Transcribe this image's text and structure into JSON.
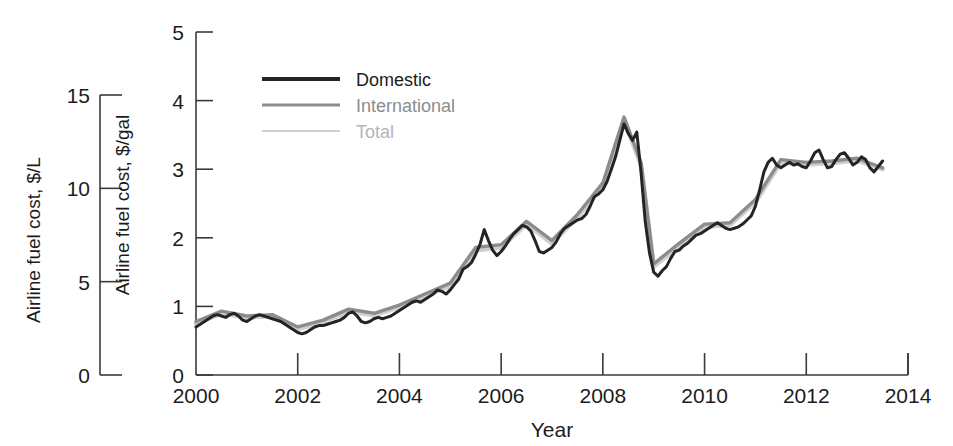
{
  "chart_data": {
    "type": "line",
    "title": "",
    "xlabel": "Year",
    "ylabel": "Airline fuel cost, $/gal",
    "ylabel_secondary": "Airline fuel cost, $/L",
    "xlim": [
      2000,
      2014
    ],
    "ylim": [
      0,
      5
    ],
    "ylim_secondary": [
      0,
      15
    ],
    "xticks": [
      2000,
      2002,
      2004,
      2006,
      2008,
      2010,
      2012,
      2014
    ],
    "xticklabels": [
      "2000",
      "2002",
      "2004",
      "2006",
      "2008",
      "2010",
      "2012",
      "2014"
    ],
    "yticks": [
      0,
      1,
      2,
      3,
      4,
      5
    ],
    "yticklabels": [
      "0",
      "1",
      "2",
      "3",
      "4",
      "5"
    ],
    "yticks_secondary": [
      0,
      5,
      10,
      15
    ],
    "yticklabels_secondary": [
      "0",
      "5",
      "10",
      "15"
    ],
    "grid": false,
    "legend_position": "upper left inside",
    "series": [
      {
        "name": "Domestic",
        "color": "#242424",
        "x": [
          2000.0,
          2000.083,
          2000.167,
          2000.25,
          2000.333,
          2000.417,
          2000.5,
          2000.583,
          2000.667,
          2000.75,
          2000.833,
          2000.917,
          2001.0,
          2001.083,
          2001.167,
          2001.25,
          2001.333,
          2001.417,
          2001.5,
          2001.583,
          2001.667,
          2001.75,
          2001.833,
          2001.917,
          2002.0,
          2002.083,
          2002.167,
          2002.25,
          2002.333,
          2002.417,
          2002.5,
          2002.583,
          2002.667,
          2002.75,
          2002.833,
          2002.917,
          2003.0,
          2003.083,
          2003.167,
          2003.25,
          2003.333,
          2003.417,
          2003.5,
          2003.583,
          2003.667,
          2003.75,
          2003.833,
          2003.917,
          2004.0,
          2004.083,
          2004.167,
          2004.25,
          2004.333,
          2004.417,
          2004.5,
          2004.583,
          2004.667,
          2004.75,
          2004.833,
          2004.917,
          2005.0,
          2005.083,
          2005.167,
          2005.25,
          2005.333,
          2005.417,
          2005.5,
          2005.583,
          2005.667,
          2005.75,
          2005.833,
          2005.917,
          2006.0,
          2006.083,
          2006.167,
          2006.25,
          2006.333,
          2006.417,
          2006.5,
          2006.583,
          2006.667,
          2006.75,
          2006.833,
          2006.917,
          2007.0,
          2007.083,
          2007.167,
          2007.25,
          2007.333,
          2007.417,
          2007.5,
          2007.583,
          2007.667,
          2007.75,
          2007.833,
          2007.917,
          2008.0,
          2008.083,
          2008.167,
          2008.25,
          2008.333,
          2008.417,
          2008.5,
          2008.583,
          2008.667,
          2008.75,
          2008.833,
          2008.917,
          2009.0,
          2009.083,
          2009.167,
          2009.25,
          2009.333,
          2009.417,
          2009.5,
          2009.583,
          2009.667,
          2009.75,
          2009.833,
          2009.917,
          2010.0,
          2010.083,
          2010.167,
          2010.25,
          2010.333,
          2010.417,
          2010.5,
          2010.583,
          2010.667,
          2010.75,
          2010.833,
          2010.917,
          2011.0,
          2011.083,
          2011.167,
          2011.25,
          2011.333,
          2011.417,
          2011.5,
          2011.583,
          2011.667,
          2011.75,
          2011.833,
          2011.917,
          2012.0,
          2012.083,
          2012.167,
          2012.25,
          2012.333,
          2012.417,
          2012.5,
          2012.583,
          2012.667,
          2012.75,
          2012.833,
          2012.917,
          2013.0,
          2013.083,
          2013.167,
          2013.25,
          2013.333,
          2013.417,
          2013.5
        ],
        "values": [
          0.7,
          0.74,
          0.78,
          0.82,
          0.86,
          0.88,
          0.86,
          0.84,
          0.88,
          0.9,
          0.86,
          0.8,
          0.78,
          0.82,
          0.86,
          0.88,
          0.86,
          0.84,
          0.82,
          0.8,
          0.78,
          0.74,
          0.7,
          0.66,
          0.62,
          0.6,
          0.62,
          0.66,
          0.7,
          0.72,
          0.72,
          0.74,
          0.76,
          0.78,
          0.8,
          0.84,
          0.9,
          0.92,
          0.86,
          0.78,
          0.76,
          0.78,
          0.82,
          0.84,
          0.82,
          0.84,
          0.86,
          0.9,
          0.94,
          0.98,
          1.02,
          1.06,
          1.08,
          1.06,
          1.1,
          1.14,
          1.18,
          1.24,
          1.22,
          1.18,
          1.24,
          1.32,
          1.4,
          1.54,
          1.58,
          1.64,
          1.76,
          1.9,
          2.12,
          1.96,
          1.82,
          1.74,
          1.8,
          1.88,
          1.98,
          2.06,
          2.12,
          2.18,
          2.16,
          2.1,
          1.96,
          1.8,
          1.78,
          1.82,
          1.86,
          1.94,
          2.06,
          2.14,
          2.18,
          2.22,
          2.26,
          2.28,
          2.34,
          2.46,
          2.6,
          2.64,
          2.7,
          2.82,
          3.0,
          3.18,
          3.42,
          3.66,
          3.52,
          3.42,
          3.54,
          2.96,
          2.24,
          1.78,
          1.5,
          1.44,
          1.52,
          1.58,
          1.7,
          1.8,
          1.82,
          1.88,
          1.92,
          1.98,
          2.04,
          2.06,
          2.1,
          2.14,
          2.18,
          2.22,
          2.18,
          2.14,
          2.12,
          2.14,
          2.16,
          2.2,
          2.26,
          2.32,
          2.46,
          2.7,
          2.96,
          3.1,
          3.16,
          3.06,
          3.02,
          3.06,
          3.1,
          3.06,
          3.08,
          3.04,
          3.02,
          3.12,
          3.24,
          3.28,
          3.14,
          3.02,
          3.04,
          3.14,
          3.22,
          3.24,
          3.16,
          3.06,
          3.1,
          3.18,
          3.14,
          3.02,
          2.96,
          3.04,
          3.12
        ],
        "legend_style": "solid thick dark"
      },
      {
        "name": "International",
        "color": "#8c8c8c",
        "x": [
          2000.0,
          2000.5,
          2001.0,
          2001.5,
          2002.0,
          2002.5,
          2003.0,
          2003.5,
          2004.0,
          2004.5,
          2005.0,
          2005.5,
          2006.0,
          2006.5,
          2007.0,
          2007.5,
          2008.0,
          2008.417,
          2008.75,
          2009.0,
          2009.5,
          2010.0,
          2010.5,
          2011.0,
          2011.5,
          2012.0,
          2012.5,
          2013.0,
          2013.5
        ],
        "values": [
          0.78,
          0.93,
          0.86,
          0.88,
          0.7,
          0.8,
          0.96,
          0.9,
          1.02,
          1.18,
          1.34,
          1.86,
          1.9,
          2.24,
          1.96,
          2.34,
          2.8,
          3.76,
          3.1,
          1.62,
          1.92,
          2.2,
          2.22,
          2.56,
          3.14,
          3.1,
          3.12,
          3.16,
          3.02
        ],
        "legend_style": "solid medium gray"
      },
      {
        "name": "Total",
        "color": "#cfcfcf",
        "x": [
          2000.0,
          2000.5,
          2001.0,
          2001.5,
          2002.0,
          2002.5,
          2003.0,
          2003.5,
          2004.0,
          2004.5,
          2005.0,
          2005.5,
          2006.0,
          2006.5,
          2007.0,
          2007.5,
          2008.0,
          2008.417,
          2008.75,
          2009.0,
          2009.5,
          2010.0,
          2010.5,
          2011.0,
          2011.5,
          2012.0,
          2012.5,
          2013.0,
          2013.5
        ],
        "values": [
          0.75,
          0.9,
          0.84,
          0.86,
          0.67,
          0.77,
          0.93,
          0.87,
          0.99,
          1.15,
          1.3,
          1.82,
          1.86,
          2.2,
          1.92,
          2.3,
          2.76,
          3.72,
          3.06,
          1.58,
          1.88,
          2.16,
          2.19,
          2.52,
          3.1,
          3.07,
          3.09,
          3.13,
          3.0
        ],
        "legend_style": "solid light gray"
      }
    ]
  },
  "legend": {
    "items": [
      {
        "label": "Domestic",
        "color": "#242424",
        "text_color": "#1c1c1c"
      },
      {
        "label": "International",
        "color": "#8c8c8c",
        "text_color": "#8c8c8c"
      },
      {
        "label": "Total",
        "color": "#cfcfcf",
        "text_color": "#b5b5b5"
      }
    ]
  },
  "axes": {
    "primary_y_label": "Airline fuel cost, $/gal",
    "secondary_y_label": "Airline fuel cost, $/L",
    "x_label": "Year"
  }
}
